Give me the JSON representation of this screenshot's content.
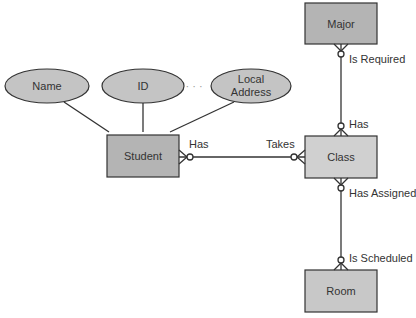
{
  "diagram": {
    "type": "entity-relationship",
    "entities": [
      {
        "id": "major",
        "label": "Major"
      },
      {
        "id": "student",
        "label": "Student"
      },
      {
        "id": "class",
        "label": "Class"
      },
      {
        "id": "room",
        "label": "Room"
      }
    ],
    "attributes": [
      {
        "id": "name",
        "label": "Name"
      },
      {
        "id": "id",
        "label": "ID"
      },
      {
        "id": "local_address",
        "line1": "Local",
        "line2": "Address"
      }
    ],
    "ellipsis": "· · ·",
    "relationships": [
      {
        "from": "student",
        "to": "class",
        "from_label": "Has",
        "to_label": "Takes"
      },
      {
        "from": "major",
        "to": "class",
        "from_label": "Is Required",
        "to_label": "Has"
      },
      {
        "from": "class",
        "to": "room",
        "from_label": "Has Assigned",
        "to_label": "Is Scheduled"
      }
    ]
  },
  "colors": {
    "entity_dark": "#b4b4b4",
    "entity_light": "#d0d0d0",
    "attribute": "#c4c4c4",
    "stroke": "#333333"
  }
}
